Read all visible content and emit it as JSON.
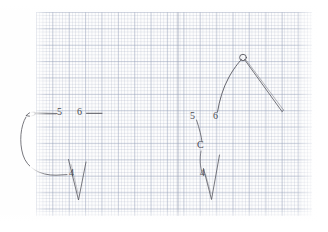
{
  "page": {
    "kind": "scanned-handdrawn-sketch",
    "surface": "graph-paper",
    "ink_color": "#55555d",
    "grid_major_color": "#96a0b9",
    "grid_minor_color": "#8c96b2",
    "background_color": "#fefefe"
  },
  "figures": [
    {
      "id": "left-figure",
      "name": "left-hook-diagram",
      "labels": [
        {
          "id": "left-label-5",
          "text": "5",
          "x": 58,
          "y": 112
        },
        {
          "id": "left-label-6",
          "text": "6",
          "x": 78,
          "y": 112
        },
        {
          "id": "left-label-4",
          "text": "4",
          "x": 70,
          "y": 172
        }
      ]
    },
    {
      "id": "right-figure",
      "name": "right-hook-diagram",
      "labels": [
        {
          "id": "right-label-5",
          "text": "5",
          "x": 191,
          "y": 117
        },
        {
          "id": "right-label-6",
          "text": "6",
          "x": 214,
          "y": 117
        },
        {
          "id": "right-label-c",
          "text": "C",
          "x": 199,
          "y": 146
        },
        {
          "id": "right-label-4",
          "text": "4",
          "x": 201,
          "y": 174
        }
      ]
    }
  ],
  "annotations": {
    "leader_lines": 3,
    "fold_line_x": 178
  }
}
